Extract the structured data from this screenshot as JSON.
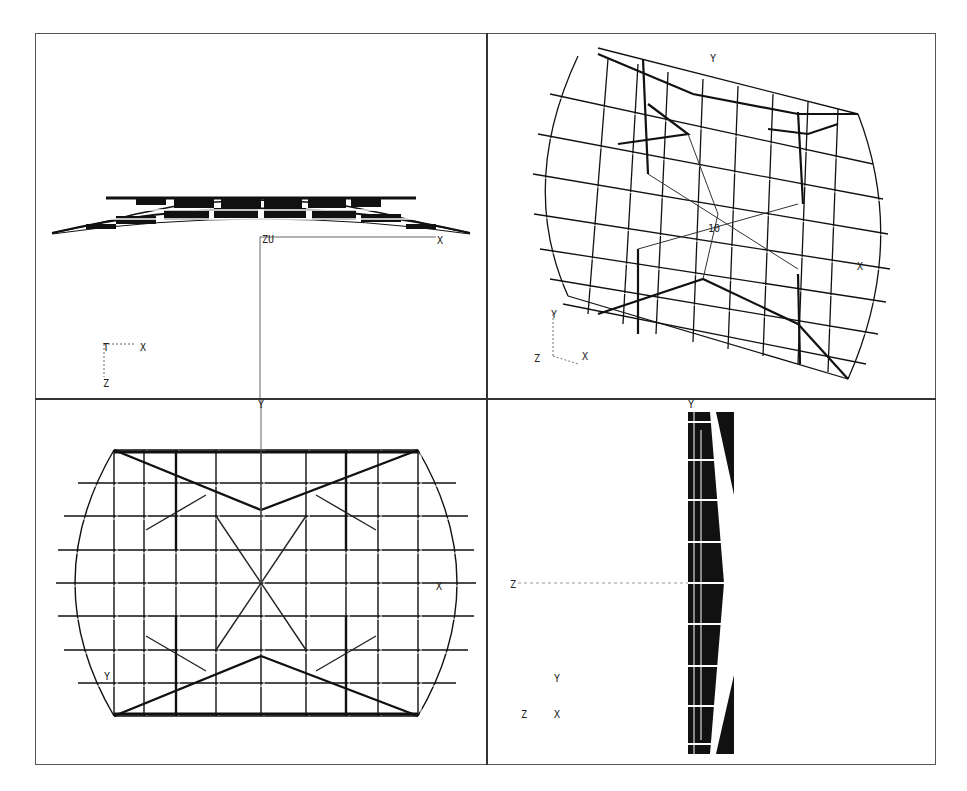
{
  "figure": {
    "line_color": "#111111",
    "background": "#ffffff"
  },
  "viewports": [
    {
      "name": "front-view",
      "position": "top-left",
      "origin_label": "ZU",
      "axis_x_label": "X",
      "triad": {
        "up": "T",
        "right": "X",
        "down": "Z"
      }
    },
    {
      "name": "isometric-view",
      "position": "top-right",
      "origin_label": "10",
      "axis_y_label": "Y",
      "axis_x_label": "X",
      "triad": {
        "up": "Y",
        "left": "Z",
        "right": "X"
      }
    },
    {
      "name": "top-view",
      "position": "bottom-left",
      "axis_y_label": "Y",
      "axis_x_label": "X",
      "marker_label": "Y"
    },
    {
      "name": "side-view",
      "position": "bottom-right",
      "axis_y_label": "Y",
      "axis_z_label": "Z",
      "triad": {
        "up": "Y",
        "left": "Z",
        "right": "X"
      }
    }
  ]
}
